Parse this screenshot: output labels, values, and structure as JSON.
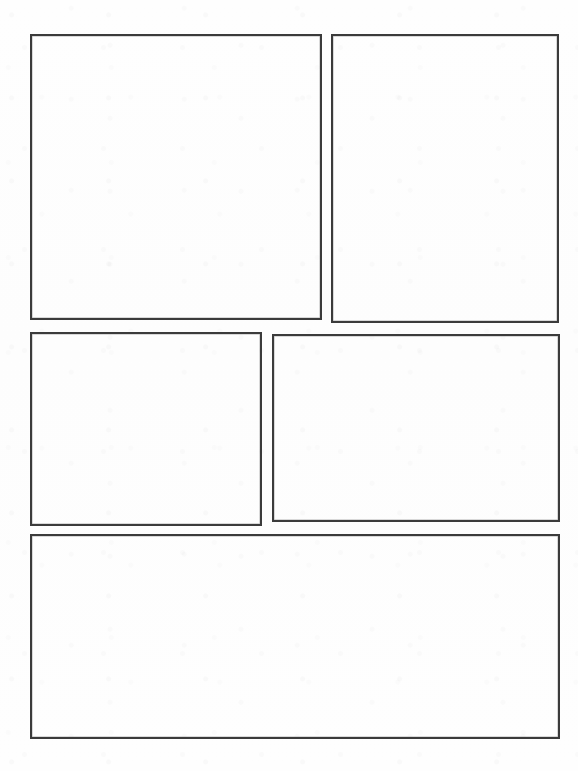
{
  "page": {
    "kind": "comic-page-template",
    "width": 578,
    "height": 771,
    "background_color": "#fefefe",
    "border_color": "#3b3b3b",
    "border_width_px": 2,
    "panel_count": 5,
    "row_count": 3,
    "content_text": "",
    "has_text": false,
    "has_artwork": false,
    "margins": {
      "left": 30,
      "top": 34,
      "right": 18,
      "bottom": 32
    },
    "gutters": {
      "horizontal": 9,
      "vertical": 12
    }
  },
  "rows": [
    {
      "index": 1,
      "label": "Row 1",
      "panel_ids": [
        "panel-1",
        "panel-2"
      ]
    },
    {
      "index": 2,
      "label": "Row 2",
      "panel_ids": [
        "panel-3",
        "panel-4"
      ]
    },
    {
      "index": 3,
      "label": "Row 3",
      "panel_ids": [
        "panel-5"
      ]
    }
  ],
  "panels": [
    {
      "id": "panel-1",
      "label": "Panel 1",
      "row": 1,
      "column": 1,
      "x": 30,
      "y": 34,
      "width": 292,
      "height": 286,
      "shape": "rectangle",
      "fill": "#fefefe",
      "stroke": "#3b3b3b",
      "content": ""
    },
    {
      "id": "panel-2",
      "label": "Panel 2",
      "row": 1,
      "column": 2,
      "x": 331,
      "y": 34,
      "width": 228,
      "height": 289,
      "shape": "rectangle",
      "fill": "#fefefe",
      "stroke": "#3b3b3b",
      "content": ""
    },
    {
      "id": "panel-3",
      "label": "Panel 3",
      "row": 2,
      "column": 1,
      "x": 30,
      "y": 332,
      "width": 232,
      "height": 194,
      "shape": "rectangle",
      "fill": "#fefefe",
      "stroke": "#3b3b3b",
      "content": ""
    },
    {
      "id": "panel-4",
      "label": "Panel 4",
      "row": 2,
      "column": 2,
      "x": 272,
      "y": 334,
      "width": 288,
      "height": 188,
      "shape": "rectangle",
      "fill": "#fefefe",
      "stroke": "#3b3b3b",
      "content": ""
    },
    {
      "id": "panel-5",
      "label": "Panel 5",
      "row": 3,
      "column": 1,
      "x": 30,
      "y": 534,
      "width": 530,
      "height": 205,
      "shape": "rectangle",
      "fill": "#fefefe",
      "stroke": "#3b3b3b",
      "content": ""
    }
  ]
}
